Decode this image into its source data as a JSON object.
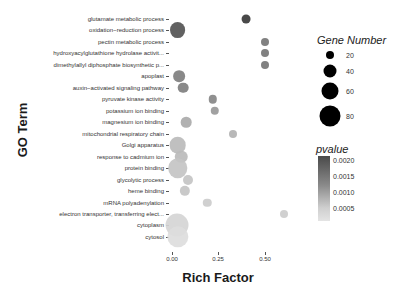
{
  "chart_data": {
    "type": "scatter",
    "subtype": "bubble",
    "title": "",
    "xlabel": "Rich Factor",
    "ylabel": "GO Term",
    "x_ticks": [
      "0.00",
      "0.25",
      "0.50"
    ],
    "xlim": [
      -0.03,
      0.65
    ],
    "grid": false,
    "categories": [
      "glutamate metabolic process",
      "oxidation−reduction process",
      "pectin metabolic process",
      "hydroxyacylglutathione hydrolase activit...",
      "dimethylallyl diphosphate biosynthetic p...",
      "apoplast",
      "auxin−activated signaling pathway",
      "pyruvate kinase activity",
      "potassium ion binding",
      "magnesium ion binding",
      "mitochondrial respiratory chain",
      "Golgi apparatus",
      "response to cadmium ion",
      "protein binding",
      "glycolytic process",
      "heme binding",
      "mRNA polyadenylation",
      "electron transporter, transferring elect...",
      "cytoplasm",
      "cytosol"
    ],
    "points": [
      {
        "term": "glutamate metabolic process",
        "rich_factor": 0.4,
        "gene_number": 6,
        "pvalue": 0.002
      },
      {
        "term": "oxidation−reduction process",
        "rich_factor": 0.03,
        "gene_number": 35,
        "pvalue": 0.0017
      },
      {
        "term": "pectin metabolic process",
        "rich_factor": 0.5,
        "gene_number": 4,
        "pvalue": 0.0013
      },
      {
        "term": "hydroxyacylglutathione hydrolase activit...",
        "rich_factor": 0.5,
        "gene_number": 4,
        "pvalue": 0.0013
      },
      {
        "term": "dimethylallyl diphosphate biosynthetic p...",
        "rich_factor": 0.5,
        "gene_number": 4,
        "pvalue": 0.0013
      },
      {
        "term": "apoplast",
        "rich_factor": 0.04,
        "gene_number": 15,
        "pvalue": 0.0012
      },
      {
        "term": "auxin−activated signaling pathway",
        "rich_factor": 0.06,
        "gene_number": 11,
        "pvalue": 0.0012
      },
      {
        "term": "pyruvate kinase activity",
        "rich_factor": 0.22,
        "gene_number": 5,
        "pvalue": 0.0011
      },
      {
        "term": "potassium ion binding",
        "rich_factor": 0.23,
        "gene_number": 5,
        "pvalue": 0.0009
      },
      {
        "term": "magnesium ion binding",
        "rich_factor": 0.075,
        "gene_number": 11,
        "pvalue": 0.0007
      },
      {
        "term": "mitochondrial respiratory chain",
        "rich_factor": 0.33,
        "gene_number": 4,
        "pvalue": 0.0006
      },
      {
        "term": "Golgi apparatus",
        "rich_factor": 0.03,
        "gene_number": 40,
        "pvalue": 0.0005
      },
      {
        "term": "response to cadmium ion",
        "rich_factor": 0.05,
        "gene_number": 18,
        "pvalue": 0.0005
      },
      {
        "term": "protein binding",
        "rich_factor": 0.03,
        "gene_number": 60,
        "pvalue": 0.0004
      },
      {
        "term": "glycolytic process",
        "rich_factor": 0.085,
        "gene_number": 9,
        "pvalue": 0.0004
      },
      {
        "term": "heme binding",
        "rich_factor": 0.07,
        "gene_number": 10,
        "pvalue": 0.0004
      },
      {
        "term": "mRNA polyadenylation",
        "rich_factor": 0.19,
        "gene_number": 5,
        "pvalue": 0.0003
      },
      {
        "term": "electron transporter, transferring elect...",
        "rich_factor": 0.6,
        "gene_number": 4,
        "pvalue": 0.0003
      },
      {
        "term": "cytoplasm",
        "rich_factor": 0.025,
        "gene_number": 90,
        "pvalue": 0.0002
      },
      {
        "term": "cytosol",
        "rich_factor": 0.03,
        "gene_number": 75,
        "pvalue": 0.0001
      }
    ],
    "legend": {
      "size": {
        "title": "Gene Number",
        "values": [
          20,
          40,
          60,
          80
        ]
      },
      "color": {
        "title": "pvalue",
        "ticks": [
          "0.0020",
          "0.0015",
          "0.0010",
          "0.0005"
        ],
        "low_color": "#e6e6e6",
        "high_color": "#3a3a3a"
      }
    }
  },
  "labels": {
    "ylabel": "GO Term",
    "xlabel": "Rich Factor",
    "size_legend_title": "Gene Number",
    "color_legend_title": "pvalue",
    "size_values": [
      "20",
      "40",
      "60",
      "80"
    ],
    "color_ticks": [
      "0.0020",
      "0.0015",
      "0.0010",
      "0.0005"
    ],
    "x_ticks": [
      "0.00",
      "0.25",
      "0.50"
    ]
  }
}
